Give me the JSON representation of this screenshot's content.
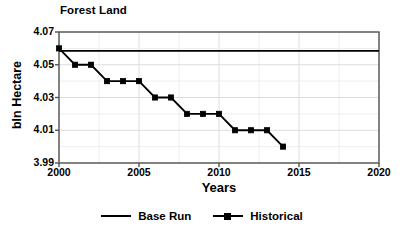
{
  "chart_data": {
    "type": "line",
    "title": "Forest Land",
    "xlabel": "Years",
    "ylabel": "bln Hectare",
    "xlim": [
      2000,
      2020
    ],
    "ylim": [
      3.99,
      4.07
    ],
    "xticks": [
      2000,
      2005,
      2010,
      2015,
      2020
    ],
    "xtick_labels": [
      "2000",
      "2005",
      "2010",
      "2015",
      "2020"
    ],
    "yticks": [
      3.99,
      4.01,
      4.03,
      4.05,
      4.07
    ],
    "ytick_labels": [
      "3.99",
      "4.01",
      "4.03",
      "4.05",
      "4.07"
    ],
    "grid": true,
    "legend_position": "bottom",
    "series": [
      {
        "name": "Base Run",
        "marker": "none",
        "color": "#000000",
        "x": [
          2000,
          2020
        ],
        "values": [
          4.0585,
          4.0585
        ]
      },
      {
        "name": "Historical",
        "marker": "square",
        "color": "#000000",
        "x": [
          2000,
          2001,
          2002,
          2003,
          2004,
          2005,
          2006,
          2007,
          2008,
          2009,
          2010,
          2011,
          2012,
          2013,
          2014
        ],
        "values": [
          4.06,
          4.05,
          4.05,
          4.04,
          4.04,
          4.04,
          4.03,
          4.03,
          4.02,
          4.02,
          4.02,
          4.01,
          4.01,
          4.01,
          4.0
        ]
      }
    ]
  },
  "legend": {
    "items": [
      {
        "label": "Base Run"
      },
      {
        "label": "Historical"
      }
    ]
  },
  "axis": {
    "ytick_0": "3.99",
    "ytick_1": "4.01",
    "ytick_2": "4.03",
    "ytick_3": "4.05",
    "ytick_4": "4.07",
    "xtick_0": "2000",
    "xtick_1": "2005",
    "xtick_2": "2010",
    "xtick_3": "2015",
    "xtick_4": "2020"
  }
}
